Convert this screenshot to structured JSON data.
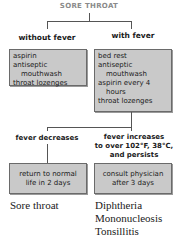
{
  "title": "SORE THROAT",
  "branches": {
    "left": {
      "label": "without fever",
      "items": [
        "aspirin",
        "antiseptic",
        "mouthwash",
        "throat lozenges"
      ]
    },
    "right": {
      "label": "with fever",
      "items": [
        "bed rest",
        "antiseptic",
        "mouthwash",
        "aspirin every 4",
        "hours",
        "throat lozenges"
      ]
    }
  },
  "outcomes": {
    "left": {
      "label": "fever decreases",
      "action": [
        "return to normal",
        "life in 2 days"
      ],
      "diagnoses": [
        "Sore throat"
      ]
    },
    "right": {
      "label": [
        "fever increases",
        "to over 102°F, 38°C,",
        "and persists"
      ],
      "action": [
        "consult physician",
        "after 3 days"
      ],
      "diagnoses": [
        "Diphtheria",
        "Mononucleosis",
        "Tonsillitis"
      ]
    }
  },
  "colors": {
    "box": "#c9c9c9",
    "title": "#8a8a8a",
    "line": "#555555"
  }
}
